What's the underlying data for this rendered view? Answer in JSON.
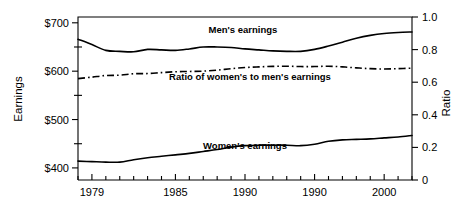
{
  "chart_data": {
    "type": "line",
    "title": "",
    "xlabel": "",
    "ylabel": "Earnings",
    "y2label": "Ratio",
    "grid": false,
    "legend_position": "inline-annotations",
    "xlim": [
      1978,
      2002
    ],
    "ylim": [
      375,
      712
    ],
    "y2lim": [
      0,
      1.0
    ],
    "x_tick_labels": [
      "1979",
      "1985",
      "1990",
      "1990",
      "2000"
    ],
    "x_tick_values": [
      1979,
      1985,
      1990,
      1995,
      2000
    ],
    "x_minor_tick_values": [
      1978,
      1980,
      1981,
      1982,
      1983,
      1984,
      1986,
      1987,
      1988,
      1989,
      1991,
      1992,
      1993,
      1994,
      1996,
      1997,
      1998,
      1999,
      2001,
      2002
    ],
    "y_tick_labels": [
      "$700",
      "$600",
      "$500",
      "$400"
    ],
    "y_tick_values": [
      700,
      600,
      500,
      400
    ],
    "y_minor_tick_values": [
      650,
      550,
      450
    ],
    "y2_tick_labels": [
      "1.0",
      "0.8",
      "0.6",
      "0.4",
      "0.2",
      "0"
    ],
    "y2_tick_values": [
      1.0,
      0.8,
      0.6,
      0.4,
      0.2,
      0
    ],
    "x": [
      1978,
      1979,
      1980,
      1981,
      1982,
      1983,
      1984,
      1985,
      1986,
      1987,
      1988,
      1989,
      1990,
      1991,
      1992,
      1993,
      1994,
      1995,
      1996,
      1997,
      1998,
      1999,
      2000,
      2001,
      2002
    ],
    "series": [
      {
        "name": "Men's earnings",
        "axis": "left",
        "style": "solid",
        "label": "Men's earnings",
        "values": [
          666,
          655,
          643,
          641,
          640,
          645,
          644,
          643,
          646,
          650,
          650,
          649,
          646,
          644,
          642,
          641,
          641,
          645,
          652,
          660,
          668,
          674,
          678,
          680,
          681
        ]
      },
      {
        "name": "Women's earnings",
        "axis": "left",
        "style": "solid",
        "label": "Women's earnings",
        "values": [
          414,
          413,
          412,
          412,
          417,
          421,
          424,
          427,
          430,
          434,
          438,
          443,
          446,
          447,
          447,
          447,
          446,
          449,
          455,
          458,
          459,
          460,
          462,
          464,
          467
        ]
      },
      {
        "name": "Ratio of women's to men's earnings",
        "axis": "right",
        "style": "dash-dot",
        "label": "Ratio of women's to men's earnings",
        "values": [
          0.622,
          0.631,
          0.641,
          0.643,
          0.652,
          0.653,
          0.659,
          0.664,
          0.666,
          0.668,
          0.674,
          0.683,
          0.69,
          0.694,
          0.697,
          0.698,
          0.696,
          0.696,
          0.698,
          0.694,
          0.688,
          0.683,
          0.681,
          0.683,
          0.686
        ]
      }
    ],
    "annotations": [
      {
        "text": "Men's earnings",
        "x": 243,
        "y": 33
      },
      {
        "text": "Ratio of women's to men's earnings",
        "x": 250,
        "y": 80
      },
      {
        "text": "Women's earnings",
        "x": 245,
        "y": 149
      }
    ]
  },
  "axes": {
    "left_title": "Earnings",
    "right_title": "Ratio"
  }
}
